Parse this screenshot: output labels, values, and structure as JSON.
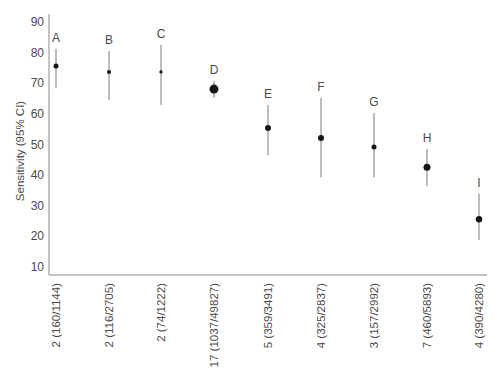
{
  "chart_data": {
    "type": "scatter",
    "subtype": "point-estimate-with-error-bars",
    "title": "",
    "xlabel": "",
    "ylabel": "Sensitivity (95% CI)",
    "ylim": [
      10,
      90
    ],
    "yticks": [
      10,
      20,
      30,
      40,
      50,
      60,
      70,
      80,
      90
    ],
    "grid": false,
    "legend": null,
    "categories": [
      "2 (160/1144)",
      "2 (116/2705)",
      "2 (74/1222)",
      "17 (1037/49827)",
      "5 (359/3491)",
      "4 (325/2837)",
      "3 (157/2992)",
      "7 (460/5893)",
      "4 (390/4280)"
    ],
    "series": [
      {
        "name": "Sensitivity",
        "labels": [
          "A",
          "B",
          "C",
          "D",
          "E",
          "F",
          "G",
          "H",
          "I"
        ],
        "values": [
          75.6,
          73.7,
          73.7,
          68.1,
          55.4,
          52.1,
          49.2,
          42.6,
          25.6
        ],
        "ci_low": [
          68.4,
          64.5,
          62.9,
          65.2,
          46.5,
          39.3,
          39.3,
          36.4,
          18.8
        ],
        "ci_high": [
          81.2,
          80.5,
          82.5,
          70.7,
          62.9,
          65.2,
          60.3,
          48.5,
          34.0
        ],
        "marker_size": [
          2.5,
          2,
          1.6,
          4.5,
          3,
          3,
          2.5,
          3.5,
          3.2
        ]
      }
    ]
  },
  "colors": {
    "axis": "#8a8a8a",
    "text": "#4a4a4a",
    "point": "#151515",
    "errorbar": "#7a7a7a"
  }
}
